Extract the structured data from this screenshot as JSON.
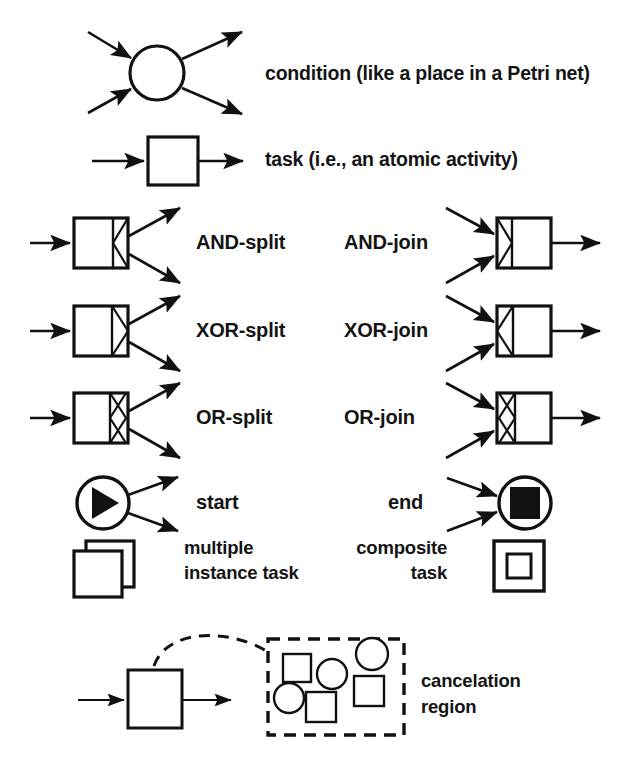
{
  "diagram": {
    "background_color": "#ffffff",
    "stroke_color": "#111111",
    "fill_color": "#ffffff",
    "rows": [
      {
        "id": "condition",
        "label": "condition (like a place in a Petri net)",
        "symbol": "circle-with-two-in-two-out-arrows"
      },
      {
        "id": "task",
        "label": "task (i.e., an atomic activity)",
        "symbol": "square-with-one-in-one-out-arrow"
      },
      {
        "id": "and-split",
        "label": "AND-split",
        "symbol": "task-with-right-compartment-left-triangle"
      },
      {
        "id": "and-join",
        "label": "AND-join",
        "symbol": "task-with-left-compartment-right-triangle"
      },
      {
        "id": "xor-split",
        "label": "XOR-split",
        "symbol": "task-with-right-compartment-right-triangle"
      },
      {
        "id": "xor-join",
        "label": "XOR-join",
        "symbol": "task-with-left-compartment-left-triangle"
      },
      {
        "id": "or-split",
        "label": "OR-split",
        "symbol": "task-with-right-compartment-diamond"
      },
      {
        "id": "or-join",
        "label": "OR-join",
        "symbol": "task-with-left-compartment-diamond"
      },
      {
        "id": "start",
        "label": "start",
        "symbol": "circle-with-filled-play-triangle"
      },
      {
        "id": "end",
        "label": "end",
        "symbol": "circle-with-filled-square"
      },
      {
        "id": "multiple-instance-task",
        "label": "multiple\ninstance task",
        "label_line1": "multiple",
        "label_line2": "instance task",
        "symbol": "two-stacked-squares"
      },
      {
        "id": "composite-task",
        "label": "composite\ntask",
        "label_line1": "composite",
        "label_line2": "task",
        "symbol": "square-inside-square"
      },
      {
        "id": "cancelation-region",
        "label": "cancelation\nregion",
        "label_line1": "cancelation",
        "label_line2": "region",
        "symbol": "task-with-dashed-arc-to-dashed-region-of-squares-and-circles"
      }
    ]
  }
}
